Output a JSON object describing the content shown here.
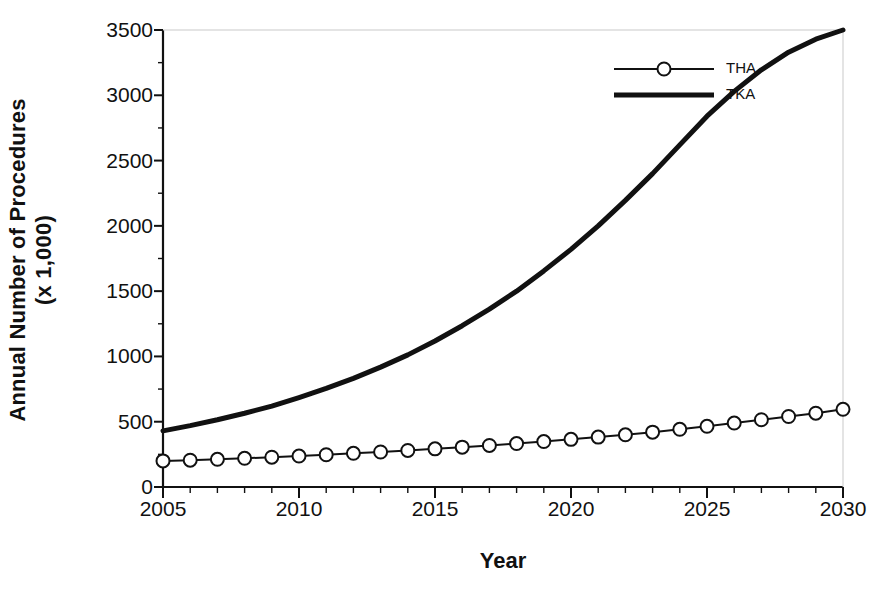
{
  "chart_data": {
    "type": "line",
    "title": "",
    "xlabel": "Year",
    "ylabel_line1": "Annual Number of Procedures",
    "ylabel_line2": "(x 1,000)",
    "xlim": [
      2005,
      2030
    ],
    "ylim": [
      0,
      3500
    ],
    "grid": false,
    "legend_position": "top-right",
    "x": [
      2005,
      2006,
      2007,
      2008,
      2009,
      2010,
      2011,
      2012,
      2013,
      2014,
      2015,
      2016,
      2017,
      2018,
      2019,
      2020,
      2021,
      2022,
      2023,
      2024,
      2025,
      2026,
      2027,
      2028,
      2029,
      2030
    ],
    "xticks_major": [
      2005,
      2010,
      2015,
      2020,
      2025,
      2030
    ],
    "xtick_labels": [
      "2005",
      "2010",
      "2015",
      "2020",
      "2025",
      "2030"
    ],
    "xticks_minor_step": 1,
    "yticks": [
      0,
      500,
      1000,
      1500,
      2000,
      2500,
      3000,
      3500
    ],
    "ytick_labels": [
      "0",
      "500",
      "1000",
      "1500",
      "2000",
      "2500",
      "3000",
      "3500"
    ],
    "series": [
      {
        "name": "THA",
        "marker": "open-circle",
        "line_width": 2,
        "color": "#111111",
        "values": [
          200,
          205,
          212,
          220,
          228,
          237,
          247,
          258,
          268,
          280,
          292,
          305,
          318,
          333,
          348,
          365,
          382,
          400,
          420,
          442,
          465,
          490,
          515,
          540,
          565,
          595
        ]
      },
      {
        "name": "TKA",
        "marker": "none",
        "line_width": 5,
        "color": "#111111",
        "values": [
          430,
          470,
          515,
          565,
          620,
          685,
          755,
          832,
          918,
          1012,
          1118,
          1235,
          1362,
          1500,
          1655,
          1820,
          2000,
          2195,
          2400,
          2620,
          2840,
          3030,
          3195,
          3330,
          3430,
          3500
        ]
      }
    ]
  },
  "legend": {
    "items": [
      {
        "label": "THA",
        "marker": "open-circle"
      },
      {
        "label": "TKA",
        "marker": "none"
      }
    ]
  },
  "colors": {
    "foreground": "#111111",
    "background": "#ffffff",
    "axis": "#111111"
  }
}
